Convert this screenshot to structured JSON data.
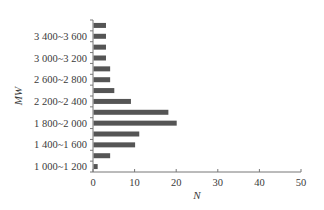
{
  "chart_data": {
    "type": "bar",
    "orientation": "horizontal",
    "title": "",
    "xlabel": "N",
    "ylabel": "MW",
    "xlim": [
      0,
      50
    ],
    "xticks": [
      0,
      10,
      20,
      30,
      40,
      50
    ],
    "grid": false,
    "legend": null,
    "bar_color": "#555555",
    "categories": [
      "1 000~1 200",
      "1 200~1 400",
      "1 400~1 600",
      "1 600~1 800",
      "1 800~2 000",
      "2 000~2 200",
      "2 200~2 400",
      "2 400~2 600",
      "2 600~2 800",
      "2 800~3 000",
      "3 000~3 200",
      "3 200~3 400",
      "3 400~3 600",
      "3 600~3 800"
    ],
    "visible_tick_labels": [
      "1 000~1 200",
      "1 400~1 600",
      "1 800~2 000",
      "2 200~2 400",
      "2 600~2 800",
      "3 000~3 200",
      "3 400~3 600"
    ],
    "values": [
      1,
      4,
      10,
      11,
      20,
      18,
      9,
      5,
      4,
      4,
      3,
      3,
      3,
      3
    ]
  }
}
